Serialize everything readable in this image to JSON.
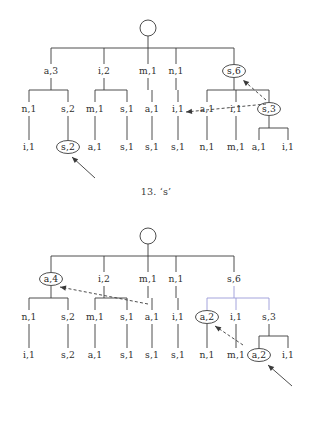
{
  "page": {
    "background_color": "#ffffff",
    "ink_color": "#3a3a3a",
    "highlight_line_color": "#9a9ad8"
  },
  "figures": [
    {
      "id": "figure-top",
      "caption": "13. ‘s’",
      "root": {
        "label": "",
        "shape": "circle",
        "x": 148,
        "y": 28
      },
      "levels": {
        "level1_y": 71,
        "level2_y": 109,
        "level3_y": 147
      },
      "nodes": [
        {
          "label": "a,3",
          "x": 51,
          "y": 71,
          "circled": false
        },
        {
          "label": "i,2",
          "x": 104,
          "y": 71,
          "circled": false
        },
        {
          "label": "m,1",
          "x": 148,
          "y": 71,
          "circled": false
        },
        {
          "label": "n,1",
          "x": 176,
          "y": 71,
          "circled": false
        },
        {
          "label": "s,6",
          "x": 234,
          "y": 71,
          "circled": true
        },
        {
          "label": "n,1",
          "x": 29,
          "y": 109,
          "circled": false
        },
        {
          "label": "s,2",
          "x": 68,
          "y": 109,
          "circled": false
        },
        {
          "label": "m,1",
          "x": 95,
          "y": 109,
          "circled": false
        },
        {
          "label": "s,1",
          "x": 127,
          "y": 109,
          "circled": false
        },
        {
          "label": "a,1",
          "x": 152,
          "y": 109,
          "circled": false
        },
        {
          "label": "i,1",
          "x": 178,
          "y": 109,
          "circled": false
        },
        {
          "label": "a,1",
          "x": 207,
          "y": 109,
          "circled": false
        },
        {
          "label": "i,1",
          "x": 236,
          "y": 109,
          "circled": false
        },
        {
          "label": "s,3",
          "x": 269,
          "y": 109,
          "circled": true
        },
        {
          "label": "i,1",
          "x": 29,
          "y": 147,
          "circled": false
        },
        {
          "label": "s,2",
          "x": 68,
          "y": 147,
          "circled": true
        },
        {
          "label": "a,1",
          "x": 95,
          "y": 147,
          "circled": false
        },
        {
          "label": "s,1",
          "x": 127,
          "y": 147,
          "circled": false
        },
        {
          "label": "s,1",
          "x": 152,
          "y": 147,
          "circled": false
        },
        {
          "label": "s,1",
          "x": 178,
          "y": 147,
          "circled": false
        },
        {
          "label": "n,1",
          "x": 207,
          "y": 147,
          "circled": false
        },
        {
          "label": "m,1",
          "x": 236,
          "y": 147,
          "circled": false
        },
        {
          "label": "a,1",
          "x": 259,
          "y": 147,
          "circled": false
        },
        {
          "label": "i,1",
          "x": 288,
          "y": 147,
          "circled": false
        }
      ],
      "arrows": [
        {
          "name": "arrow-s6-to-s3",
          "x1": 266,
          "y1": 100,
          "x2": 243,
          "y2": 80,
          "style": "dashed"
        },
        {
          "name": "arrow-to-i1",
          "x1": 266,
          "y1": 104,
          "x2": 186,
          "y2": 112,
          "style": "dashed"
        },
        {
          "name": "arrow-pointer-s2",
          "x1": 95,
          "y1": 178,
          "x2": 72,
          "y2": 157,
          "style": "solid"
        }
      ]
    },
    {
      "id": "figure-bottom",
      "caption": "14. ‘a’",
      "root": {
        "label": "",
        "shape": "circle",
        "x": 148,
        "y": 28
      },
      "levels": {
        "level1_y": 71,
        "level2_y": 109,
        "level3_y": 147
      },
      "nodes": [
        {
          "label": "a,4",
          "x": 51,
          "y": 71,
          "circled": true
        },
        {
          "label": "i,2",
          "x": 104,
          "y": 71,
          "circled": false
        },
        {
          "label": "m,1",
          "x": 148,
          "y": 71,
          "circled": false
        },
        {
          "label": "n,1",
          "x": 176,
          "y": 71,
          "circled": false
        },
        {
          "label": "s,6",
          "x": 234,
          "y": 71,
          "circled": false
        },
        {
          "label": "n,1",
          "x": 29,
          "y": 109,
          "circled": false
        },
        {
          "label": "s,2",
          "x": 68,
          "y": 109,
          "circled": false
        },
        {
          "label": "m,1",
          "x": 95,
          "y": 109,
          "circled": false
        },
        {
          "label": "s,1",
          "x": 127,
          "y": 109,
          "circled": false
        },
        {
          "label": "a,1",
          "x": 152,
          "y": 109,
          "circled": false
        },
        {
          "label": "i,1",
          "x": 178,
          "y": 109,
          "circled": false
        },
        {
          "label": "a,2",
          "x": 207,
          "y": 109,
          "circled": true
        },
        {
          "label": "i,1",
          "x": 236,
          "y": 109,
          "circled": false
        },
        {
          "label": "s,3",
          "x": 269,
          "y": 109,
          "circled": false
        },
        {
          "label": "i,1",
          "x": 29,
          "y": 147,
          "circled": false
        },
        {
          "label": "s,2",
          "x": 68,
          "y": 147,
          "circled": false
        },
        {
          "label": "a,1",
          "x": 95,
          "y": 147,
          "circled": false
        },
        {
          "label": "s,1",
          "x": 127,
          "y": 147,
          "circled": false
        },
        {
          "label": "s,1",
          "x": 152,
          "y": 147,
          "circled": false
        },
        {
          "label": "s,1",
          "x": 178,
          "y": 147,
          "circled": false
        },
        {
          "label": "n,1",
          "x": 207,
          "y": 147,
          "circled": false
        },
        {
          "label": "m,1",
          "x": 236,
          "y": 147,
          "circled": false
        },
        {
          "label": "a,2",
          "x": 259,
          "y": 147,
          "circled": true
        },
        {
          "label": "i,1",
          "x": 288,
          "y": 147,
          "circled": false
        }
      ],
      "arrows": [
        {
          "name": "arrow-to-a4",
          "x1": 148,
          "y1": 96,
          "x2": 60,
          "y2": 79,
          "style": "dashed"
        },
        {
          "name": "arrow-to-a2",
          "x1": 243,
          "y1": 137,
          "x2": 215,
          "y2": 118,
          "style": "dashed"
        },
        {
          "name": "arrow-pointer-a2",
          "x1": 292,
          "y1": 178,
          "x2": 268,
          "y2": 157,
          "style": "solid"
        }
      ]
    }
  ]
}
